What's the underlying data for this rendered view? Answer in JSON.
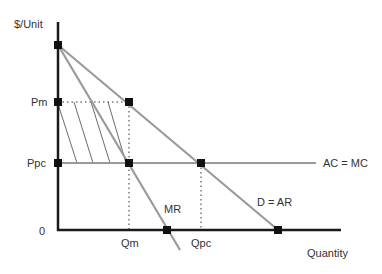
{
  "diagram": {
    "axes": {
      "y_label": "$/Unit",
      "x_label": "Quantity",
      "origin_label": "0"
    },
    "price_labels": {
      "pm": "Pm",
      "ppc": "Ppc"
    },
    "quantity_labels": {
      "qm": "Qm",
      "qpc": "Qpc"
    },
    "curves": {
      "ac_mc": "AC = MC",
      "demand": "D = AR",
      "mr": "MR"
    },
    "colors": {
      "axis": "#1a1a1a",
      "curve": "#9a9a9a",
      "marker": "#111111",
      "hatch": "#444444",
      "text": "#333333"
    }
  }
}
